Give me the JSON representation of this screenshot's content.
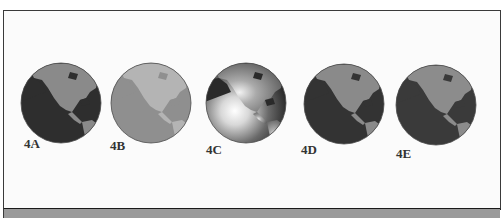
{
  "figure": {
    "items": [
      {
        "id": "4A",
        "label": "4A",
        "style": "flat-dark",
        "ocean": "#2e2e2e",
        "land": "#8a8a8a",
        "cx": 61,
        "cy": 103,
        "label_x": 24,
        "label_y": 136
      },
      {
        "id": "4B",
        "label": "4B",
        "style": "flat-light",
        "ocean": "#8f8f8f",
        "land": "#b4b4b4",
        "cx": 151,
        "cy": 103,
        "label_x": 110,
        "label_y": 138
      },
      {
        "id": "4C",
        "label": "4C",
        "style": "shaded-highlight",
        "ocean": "#3a3a3a",
        "land": "#8a8a8a",
        "cx": 246,
        "cy": 103,
        "label_x": 206,
        "label_y": 142
      },
      {
        "id": "4D",
        "label": "4D",
        "style": "flat-dark",
        "ocean": "#333333",
        "land": "#8a8a8a",
        "cx": 344,
        "cy": 104,
        "label_x": 301,
        "label_y": 142
      },
      {
        "id": "4E",
        "label": "4E",
        "style": "flat-dark-soft",
        "ocean": "#3a3a3a",
        "land": "#8c8c8c",
        "cx": 436,
        "cy": 105,
        "label_x": 396,
        "label_y": 146
      }
    ]
  },
  "colors": {
    "frame_border": "#3a3a3a",
    "bottom_bar": "#9a9a9a",
    "background": "#fbfbfb"
  }
}
